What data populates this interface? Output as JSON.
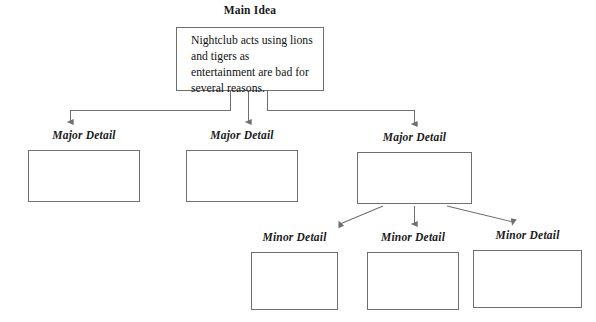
{
  "diagram": {
    "type": "concept-map",
    "background_color": "#ffffff",
    "line_color": "#6f6f6f",
    "text_color": "#121212",
    "main_idea": {
      "label": "Main Idea",
      "body": "Nightclub acts using lions and tigers as entertainment are bad for several reasons."
    },
    "major_details": [
      {
        "label": "Major Detail",
        "body": ""
      },
      {
        "label": "Major Detail",
        "body": ""
      },
      {
        "label": "Major Detail",
        "body": ""
      }
    ],
    "minor_details": [
      {
        "label": "Minor Detail",
        "body": ""
      },
      {
        "label": "Minor Detail",
        "body": ""
      },
      {
        "label": "Minor Detail",
        "body": ""
      }
    ]
  }
}
